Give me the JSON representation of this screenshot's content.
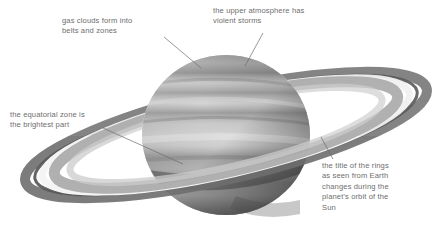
{
  "figure": {
    "background_color": "#ffffff",
    "text_color": "#6e6e6e",
    "leader_line_color": "#6b6b6b",
    "width": 448,
    "height": 234
  },
  "planet": {
    "name": "saturn-planet",
    "description": "grayscale banded gas giant sphere",
    "center_x": 226,
    "center_y": 135,
    "radius": 84,
    "highlight_color": "#d8d8d8",
    "midtone_color": "#9c9c9c",
    "shadow_color": "#5f5f5f",
    "bands": [
      {
        "name": "north-polar-hood",
        "tone": "#8f8f8f"
      },
      {
        "name": "north-temperate-belt",
        "tone": "#7f7f7f"
      },
      {
        "name": "north-tropical-zone",
        "tone": "#b9b9b9"
      },
      {
        "name": "north-equatorial-belt",
        "tone": "#8a8a8a"
      },
      {
        "name": "equatorial-zone",
        "tone": "#d4d4d4"
      },
      {
        "name": "south-equatorial-belt",
        "tone": "#8d8d8d"
      },
      {
        "name": "south-tropical-zone",
        "tone": "#aeaeae"
      },
      {
        "name": "south-polar-region",
        "tone": "#7a7a7a"
      }
    ]
  },
  "rings": {
    "name": "saturn-rings",
    "description": "tilted elliptical ring system with bright and dark divisions",
    "left_extent_x": 22,
    "right_extent_x": 432,
    "center_x": 226,
    "center_y": 135,
    "bands": [
      {
        "name": "outer-a-ring",
        "tone": "#8b8b8b"
      },
      {
        "name": "cassini-division",
        "tone": "#6a6a6a"
      },
      {
        "name": "bright-b-ring",
        "tone": "#f2f2f2"
      },
      {
        "name": "inner-b-ring",
        "tone": "#a6a6a6"
      },
      {
        "name": "faint-c-ring",
        "tone": "#c7c7c7"
      }
    ],
    "shadow_name": "ring-shadow-on-planet"
  },
  "callouts": [
    {
      "id": "gas-clouds",
      "name": "callout-gas-clouds",
      "text": "gas clouds form into\nbelts and zones",
      "text_x": 62,
      "text_y": 16,
      "leader": {
        "x1": 164,
        "y1": 37,
        "x2": 201,
        "y2": 68
      }
    },
    {
      "id": "upper-atmosphere",
      "name": "callout-upper-atmosphere",
      "text": "the upper atmosphere has\nviolent storms",
      "text_x": 213,
      "text_y": 6,
      "leader": {
        "x1": 263,
        "y1": 33,
        "x2": 245,
        "y2": 66
      }
    },
    {
      "id": "equatorial-zone",
      "name": "callout-equatorial-zone",
      "text": "the equatorial zone is\nthe brightest part",
      "text_x": 10,
      "text_y": 110,
      "leader": {
        "x1": 103,
        "y1": 128,
        "x2": 183,
        "y2": 164
      }
    },
    {
      "id": "ring-tilt",
      "name": "callout-ring-tilt",
      "text": "the title of the rings\nas seen from Earth\nchanges during the\nplanet's orbit of the\nSun",
      "text_x": 322,
      "text_y": 161,
      "leader": {
        "x1": 333,
        "y1": 159,
        "x2": 321,
        "y2": 137
      }
    }
  ]
}
